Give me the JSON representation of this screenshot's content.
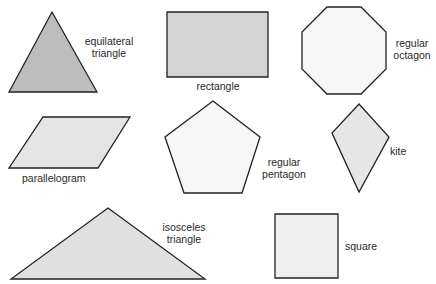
{
  "diagram": {
    "type": "geometric-shapes-reference",
    "stroke_color": "#222222",
    "shapes": [
      {
        "id": "equilateral-triangle",
        "label_lines": [
          "equilateral",
          "triangle"
        ],
        "fill": "#bdbdbd",
        "points": "52,12 97,92 9,92"
      },
      {
        "id": "rectangle",
        "label_lines": [
          "rectangle"
        ],
        "fill": "#d4d4d4",
        "points": "167,12 268,12 268,77 167,77"
      },
      {
        "id": "regular-octagon",
        "label_lines": [
          "regular",
          "octagon"
        ],
        "fill": "#f6f6f6",
        "points": "327,7 361,7 386,32 386,69 361,94 327,94 302,69 302,32"
      },
      {
        "id": "parallelogram",
        "label_lines": [
          "parallelogram"
        ],
        "fill": "#e4e4e4",
        "points": "43,117 130,117 98,168 9,168"
      },
      {
        "id": "regular-pentagon",
        "label_lines": [
          "regular",
          "pentagon"
        ],
        "fill": "#f7f7f7",
        "points": "213,101 260,137 242,193 184,193 165,137"
      },
      {
        "id": "kite",
        "label_lines": [
          "kite"
        ],
        "fill": "#e6e6e6",
        "points": "359,104 389,137 359,192 332,133"
      },
      {
        "id": "isosceles-triangle",
        "label_lines": [
          "isosceles",
          "triangle"
        ],
        "fill": "#e0e0e0",
        "points": "108,208 205,279 11,279"
      },
      {
        "id": "square",
        "label_lines": [
          "square"
        ],
        "fill": "#efefef",
        "points": "275,214 338,214 338,278 275,278"
      }
    ]
  },
  "labels": {
    "equilateral_1": "equilateral",
    "equilateral_2": "triangle",
    "rectangle": "rectangle",
    "octagon_1": "regular",
    "octagon_2": "octagon",
    "parallelogram": "parallelogram",
    "pentagon_1": "regular",
    "pentagon_2": "pentagon",
    "kite": "kite",
    "isosceles_1": "isosceles",
    "isosceles_2": "triangle",
    "square": "square"
  }
}
